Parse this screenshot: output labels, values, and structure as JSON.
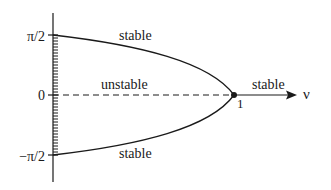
{
  "diagram": {
    "type": "bifurcation-diagram",
    "y_axis": {
      "tick_labels": [
        {
          "text": "π/2",
          "value": 1.5708
        },
        {
          "text": "0",
          "value": 0
        },
        {
          "text": "−π/2",
          "value": -1.5708
        }
      ]
    },
    "x_axis": {
      "label": "ν",
      "tick_labels": [
        {
          "text": "1",
          "value": 1
        }
      ]
    },
    "regions": {
      "upper_branch": "stable",
      "lower_branch": "stable",
      "middle_dashed": "unstable",
      "right_axis": "stable"
    },
    "bifurcation_point": {
      "nu": 1,
      "value": 0
    },
    "colors": {
      "line": "#1a1a1a",
      "background": "#ffffff"
    }
  }
}
